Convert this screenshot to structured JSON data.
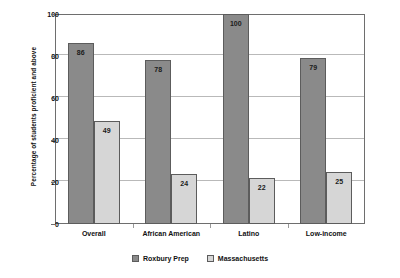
{
  "chart_data": {
    "type": "bar",
    "title": "",
    "subtitle": "",
    "xlabel": "",
    "ylabel": "Percentage of students proficient and above",
    "ylim": [
      0,
      100
    ],
    "yticks": [
      0,
      20,
      40,
      60,
      80,
      100
    ],
    "ytick_labels": [
      "0",
      "20",
      "40",
      "60",
      "80",
      "100"
    ],
    "grid": "horizontal",
    "legend_position": "bottom-center",
    "categories": [
      "Overall",
      "African American",
      "Latino",
      "Low-income"
    ],
    "series": [
      {
        "name": "Roxbury Prep",
        "color": "#8a8a8a",
        "values": [
          86,
          78,
          100,
          79
        ],
        "labels": [
          "86",
          "78",
          "100",
          "79"
        ]
      },
      {
        "name": "Massachusetts",
        "color": "#d6d6d6",
        "values": [
          49,
          24,
          22,
          25
        ],
        "labels": [
          "49",
          "24",
          "22",
          "25"
        ]
      }
    ]
  },
  "legend": {
    "items": [
      {
        "label": "Roxbury Prep",
        "swatch": "series-0"
      },
      {
        "label": "Massachusetts",
        "swatch": "series-1"
      }
    ]
  },
  "colors": {
    "series_0": "#8a8a8a",
    "series_1": "#d6d6d6",
    "grid": "#b9b9b9",
    "frame": "#6e6e6e",
    "text": "#111111",
    "background": "#ffffff"
  }
}
